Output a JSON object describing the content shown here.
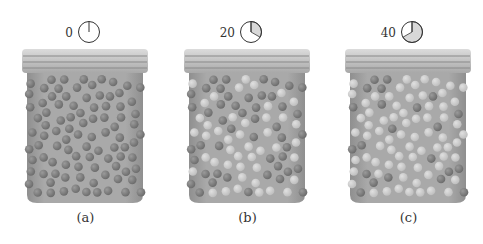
{
  "figure": {
    "panels": [
      {
        "id": "a",
        "caption": "(a)",
        "time": "0",
        "clock_fraction": 0,
        "dark_ratio": 1.0,
        "center_x": 85
      },
      {
        "id": "b",
        "caption": "(b)",
        "time": "20",
        "clock_fraction": 0.333,
        "dark_ratio": 0.5,
        "center_x": 247
      },
      {
        "id": "c",
        "caption": "(c)",
        "time": "40",
        "clock_fraction": 0.667,
        "dark_ratio": 0.25,
        "center_x": 408
      }
    ],
    "colors": {
      "jar_body": "#a9a9a9",
      "jar_lid": "#c4c4c4",
      "dark_ball": "#6a6a6a",
      "light_ball": "#bdbdbd",
      "clock_fill": "#d8d8d8",
      "clock_stroke": "#333333"
    }
  }
}
